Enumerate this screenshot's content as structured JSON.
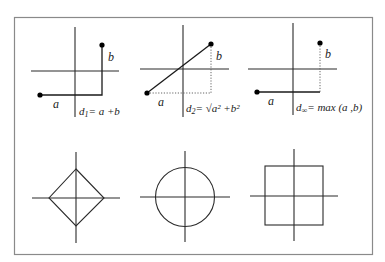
{
  "figure": {
    "frame_color": "#8a8a8a",
    "line_color": "#2a2a2a"
  },
  "panels_top": [
    {
      "name": "manhattan",
      "label_a": "a",
      "label_b": "b",
      "formula_d": "d",
      "formula_sub": "1",
      "formula_rhs": "= a +b"
    },
    {
      "name": "euclidean",
      "label_a": "a",
      "label_b": "b",
      "formula_d": "d",
      "formula_sub": "2",
      "formula_rhs": "= √a² +b²"
    },
    {
      "name": "chebyshev",
      "label_a": "a",
      "label_b": "b",
      "formula_d": "d",
      "formula_sub": "∞",
      "formula_rhs": "= max (a ,b)"
    }
  ],
  "panels_bottom": [
    {
      "name": "l1-unit-ball",
      "shape": "diamond"
    },
    {
      "name": "l2-unit-ball",
      "shape": "circle"
    },
    {
      "name": "linf-unit-ball",
      "shape": "square"
    }
  ]
}
